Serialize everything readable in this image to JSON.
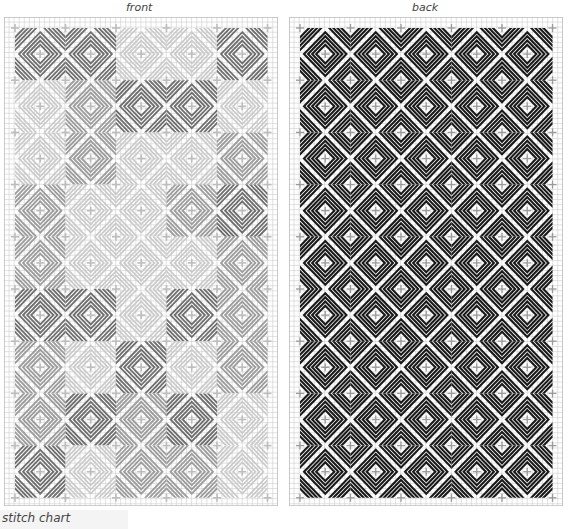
{
  "panels": {
    "front": {
      "label": "front"
    },
    "back": {
      "label": "back"
    }
  },
  "caption": "stitch chart",
  "colors": {
    "grid": "#cfcfcf",
    "cross": "#bdbdbd",
    "dark": "#6e6e6e",
    "mid": "#9c9c9c",
    "light": "#c9c9c9",
    "back": "#1a1a1a"
  },
  "front_blocks": [
    [
      "D",
      "D",
      "L",
      "L",
      "D"
    ],
    [
      "L",
      "M",
      "D",
      "D",
      "L"
    ],
    [
      "L",
      "M",
      "L",
      "L",
      "M"
    ],
    [
      "M",
      "L",
      "L",
      "M",
      "D"
    ],
    [
      "M",
      "L",
      "L",
      "L",
      "M"
    ],
    [
      "D",
      "D",
      "L",
      "D",
      "M"
    ],
    [
      "M",
      "L",
      "D",
      "L",
      "M"
    ],
    [
      "M",
      "D",
      "M",
      "D",
      "L"
    ],
    [
      "D",
      "L",
      "M",
      "M",
      "L"
    ]
  ]
}
